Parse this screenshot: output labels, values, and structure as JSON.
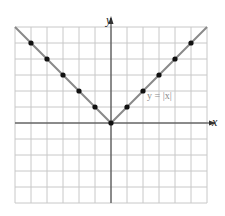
{
  "chart_data": {
    "type": "line",
    "title": "",
    "xlabel": "x",
    "ylabel": "y",
    "function_label": "y = |x|",
    "xlim": [
      -6,
      6
    ],
    "ylim": [
      -5,
      6
    ],
    "grid": true,
    "grid_step": 1,
    "series": [
      {
        "name": "y = |x|",
        "line_x": [
          -6,
          0,
          6
        ],
        "line_y": [
          6,
          0,
          6
        ],
        "points_x": [
          -5,
          -4,
          -3,
          -2,
          -1,
          0,
          1,
          2,
          3,
          4,
          5
        ],
        "points_y": [
          5,
          4,
          3,
          2,
          1,
          0,
          1,
          2,
          3,
          4,
          5
        ]
      }
    ],
    "colors": {
      "line": "#8a8a8a",
      "points": "#111111",
      "grid": "#c8c8c8",
      "axes": "#333333"
    }
  },
  "labels": {
    "x_axis": "x",
    "y_axis": "y",
    "function": "y = |x|"
  }
}
